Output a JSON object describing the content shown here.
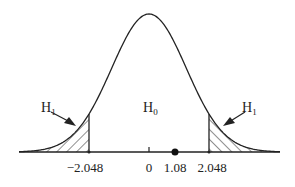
{
  "figure": {
    "type": "two-tailed t-distribution rejection regions",
    "regions": {
      "left": {
        "label": "H",
        "subscript": "1"
      },
      "center": {
        "label": "H",
        "subscript": "0"
      },
      "right": {
        "label": "H",
        "subscript": "1"
      }
    },
    "axis": {
      "ticks": [
        {
          "value": -2.048,
          "label": "−2.048"
        },
        {
          "value": 0,
          "label": "0"
        },
        {
          "value": 1.08,
          "label": "1.08"
        },
        {
          "value": 2.048,
          "label": "2.048"
        }
      ],
      "critical_values": [
        -2.048,
        2.048
      ],
      "test_statistic": 1.08
    },
    "colors": {
      "stroke": "#222222",
      "background": "#ffffff"
    }
  }
}
